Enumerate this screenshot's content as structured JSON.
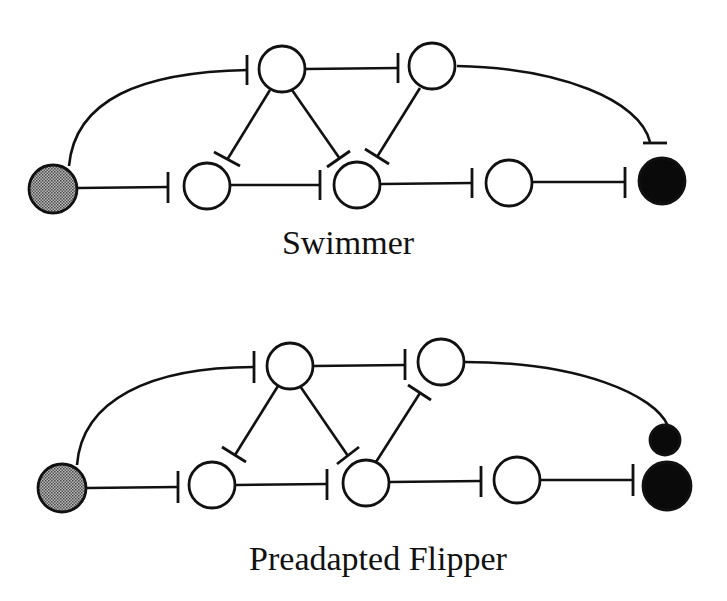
{
  "panels": [
    {
      "id": "swimmer",
      "caption": "Swimmer",
      "nodes": [
        {
          "id": "sensory",
          "type": "gray"
        },
        {
          "id": "top-left",
          "type": "open"
        },
        {
          "id": "top-right",
          "type": "open"
        },
        {
          "id": "bottom-1",
          "type": "open"
        },
        {
          "id": "bottom-2",
          "type": "open"
        },
        {
          "id": "bottom-3",
          "type": "open"
        },
        {
          "id": "output",
          "type": "black"
        }
      ],
      "edges": [
        {
          "from": "sensory",
          "to": "top-left",
          "kind": "inhibit"
        },
        {
          "from": "sensory",
          "to": "bottom-1",
          "kind": "inhibit"
        },
        {
          "from": "top-left",
          "to": "top-right",
          "kind": "inhibit"
        },
        {
          "from": "top-left",
          "to": "bottom-1",
          "kind": "inhibit"
        },
        {
          "from": "top-left",
          "to": "bottom-2",
          "kind": "inhibit"
        },
        {
          "from": "top-right",
          "to": "bottom-2",
          "kind": "inhibit"
        },
        {
          "from": "top-right",
          "to": "output",
          "kind": "inhibit"
        },
        {
          "from": "bottom-1",
          "to": "bottom-2",
          "kind": "inhibit"
        },
        {
          "from": "bottom-2",
          "to": "bottom-3",
          "kind": "inhibit"
        },
        {
          "from": "bottom-3",
          "to": "output",
          "kind": "inhibit"
        }
      ]
    },
    {
      "id": "preadapted-flipper",
      "caption": "Preadapted Flipper",
      "nodes": [
        {
          "id": "sensory",
          "type": "gray"
        },
        {
          "id": "top-left",
          "type": "open"
        },
        {
          "id": "top-right",
          "type": "open"
        },
        {
          "id": "bottom-1",
          "type": "open"
        },
        {
          "id": "bottom-2",
          "type": "open"
        },
        {
          "id": "bottom-3",
          "type": "open"
        },
        {
          "id": "output-upper",
          "type": "black"
        },
        {
          "id": "output-lower",
          "type": "black"
        }
      ],
      "edges": [
        {
          "from": "sensory",
          "to": "top-left",
          "kind": "inhibit"
        },
        {
          "from": "sensory",
          "to": "bottom-1",
          "kind": "inhibit"
        },
        {
          "from": "top-left",
          "to": "top-right",
          "kind": "inhibit"
        },
        {
          "from": "top-left",
          "to": "bottom-1",
          "kind": "inhibit"
        },
        {
          "from": "top-left",
          "to": "bottom-2",
          "kind": "inhibit"
        },
        {
          "from": "bottom-2",
          "to": "top-right",
          "kind": "inhibit"
        },
        {
          "from": "top-right",
          "to": "output-upper",
          "kind": "connect"
        },
        {
          "from": "bottom-1",
          "to": "bottom-2",
          "kind": "inhibit"
        },
        {
          "from": "bottom-2",
          "to": "bottom-3",
          "kind": "inhibit"
        },
        {
          "from": "bottom-3",
          "to": "output-lower",
          "kind": "inhibit"
        }
      ]
    }
  ]
}
